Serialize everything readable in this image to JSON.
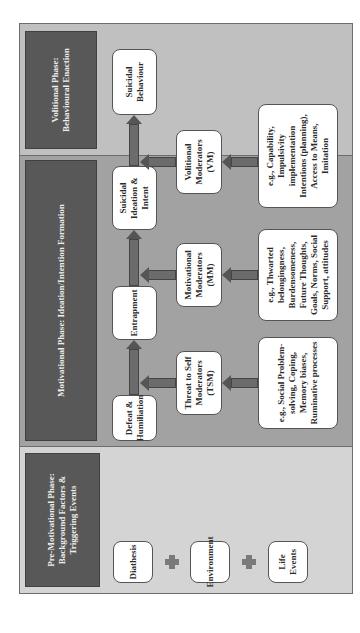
{
  "phases": {
    "pre_motivational": {
      "title": "Pre-Motivational Phase: Background Factors & Triggering Events",
      "items": [
        "Diathesis",
        "Environment",
        "Life Events"
      ],
      "connector": "plus"
    },
    "motivational": {
      "title": "Motivational Phase: Ideation/Intention Formation",
      "flow": [
        "Defeat & Humiliation",
        "Entrapment",
        "Suicidal Ideation & Intent"
      ],
      "moderators": [
        {
          "label": "Threat to Self Moderators (TSM)",
          "examples": "e.g., Social Problem-solving, Coping, Memory biases, Ruminative processes"
        },
        {
          "label": "Motivational Moderators (MM)",
          "examples": "e.g., Thwarted belongingness, Burdensomeness, Future Thoughts, Goals, Norms, Social Support, attitudes"
        }
      ]
    },
    "volitional": {
      "title": "Volitional Phase: Behavioural Enaction",
      "outcome": "Suicidal Behaviour",
      "moderator": {
        "label": "Volitional Moderators (VM)",
        "examples": "e.g., Capability, Impulsivity implementation Intentions (planning), Access to Means, Imitation"
      }
    }
  },
  "colors": {
    "pre_panel": "#d4d4d4",
    "motivational_panel": "#a2a2a2",
    "volitional_panel": "#c0c0c0",
    "header": "#585858",
    "arrow": "#6b6b6b",
    "box": "#ffffff"
  }
}
